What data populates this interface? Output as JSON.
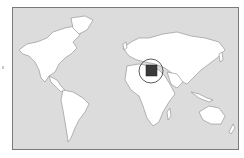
{
  "map": {
    "type": "world locator map",
    "highlighted_country": "Egypt",
    "colors": {
      "ocean": "#dcdcdc",
      "land": "#ffffff",
      "border": "#7a7a7a",
      "highlight": "#3a3a3a",
      "circle": "#333333"
    }
  }
}
